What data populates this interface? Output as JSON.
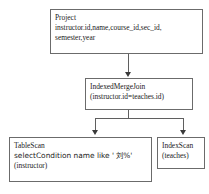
{
  "diagram": {
    "colors": {
      "background": "#ffffff",
      "node_border": "#6b6b6b",
      "edge": "#5f5f5f",
      "arrowhead": "#3a3a3a",
      "text": "#1a1a1a"
    },
    "nodes": [
      {
        "id": "project",
        "lines": [
          "Project",
          "instructor.id,name,course_id,sec_id,",
          "semester,year"
        ]
      },
      {
        "id": "indexed_merge_join",
        "lines": [
          "IndexedMergeJoin",
          "(instructor.id=teaches.id)"
        ]
      },
      {
        "id": "table_scan",
        "lines": [
          "TableScan",
          "selectCondition name like ' 刘%'",
          "(instructor)"
        ]
      },
      {
        "id": "index_scan",
        "lines": [
          "IndexScan",
          "(teaches)"
        ]
      }
    ],
    "edges": [
      {
        "from": "project",
        "to": "indexed_merge_join",
        "direction": "down"
      },
      {
        "from": "indexed_merge_join",
        "to": "table_scan",
        "direction": "down"
      },
      {
        "from": "indexed_merge_join",
        "to": "index_scan",
        "direction": "down"
      }
    ]
  }
}
